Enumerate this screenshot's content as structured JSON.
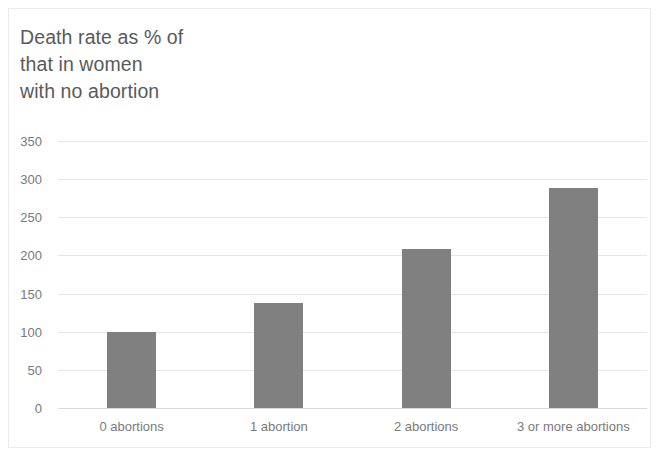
{
  "chart_data": {
    "type": "bar",
    "title_lines": [
      "Death rate as % of",
      "that in women",
      "with no abortion"
    ],
    "categories": [
      "0 abortions",
      "1 abortion",
      "2 abortions",
      "3 or more abortions"
    ],
    "values": [
      100,
      138,
      208,
      288
    ],
    "series": [
      {
        "name": "Death rate as % of that in women with no abortion",
        "values": [
          100,
          138,
          208,
          288
        ]
      }
    ],
    "xlabel": "",
    "ylabel": "",
    "ylim": [
      0,
      350
    ],
    "yticks": [
      0,
      50,
      100,
      150,
      200,
      250,
      300,
      350
    ],
    "ytick_labels": [
      "0",
      "50",
      "100",
      "150",
      "200",
      "250",
      "300",
      "350"
    ],
    "grid": true,
    "grid_axis": "y",
    "legend": false,
    "legend_position": "none",
    "bar_color": "#808080",
    "gridline_color": "#e6e6e6",
    "axis_color": "#d9d9d9",
    "title_color": "#5a5a5a",
    "tick_label_color": "#7a7a7a",
    "background_color": "#ffffff",
    "border_color": "#ebebeb"
  }
}
